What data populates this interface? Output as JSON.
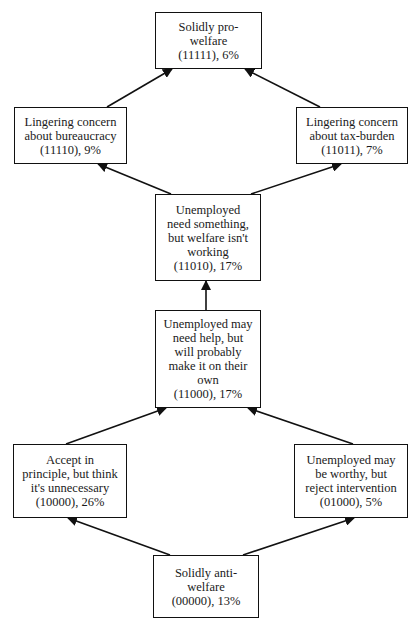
{
  "diagram": {
    "type": "hierarchical-flow",
    "colors": {
      "stroke": "#111111",
      "text": "#1a1a1a",
      "background": "#ffffff"
    },
    "nodes": [
      {
        "id": "11111",
        "lines": [
          "Solidly pro-",
          "welfare",
          "(11111), 6%"
        ],
        "label": "Solidly pro-welfare",
        "code": "11111",
        "percent": "6%"
      },
      {
        "id": "11110",
        "lines": [
          "Lingering concern",
          "about bureaucracy",
          "(11110),  9%"
        ],
        "label": "Lingering concern about bureaucracy",
        "code": "11110",
        "percent": "9%"
      },
      {
        "id": "11011",
        "lines": [
          "Lingering concern",
          "about tax-burden",
          "(11011), 7%"
        ],
        "label": "Lingering concern about tax-burden",
        "code": "11011",
        "percent": "7%"
      },
      {
        "id": "11010",
        "lines": [
          "Unemployed",
          "need something,",
          "but welfare isn't",
          "working",
          "(11010), 17%"
        ],
        "label": "Unemployed need something, but welfare isn't working",
        "code": "11010",
        "percent": "17%"
      },
      {
        "id": "11000",
        "lines": [
          "Unemployed may",
          "need help, but",
          "will probably",
          "make it on their",
          "own",
          "(11000), 17%"
        ],
        "label": "Unemployed may need help, but will probably make it on their own",
        "code": "11000",
        "percent": "17%"
      },
      {
        "id": "10000",
        "lines": [
          "Accept in",
          "principle, but think",
          "it's unnecessary",
          "(10000), 26%"
        ],
        "label": "Accept in principle, but think it's unnecessary",
        "code": "10000",
        "percent": "26%"
      },
      {
        "id": "01000",
        "lines": [
          "Unemployed may",
          "be worthy, but",
          "reject intervention",
          "(01000), 5%"
        ],
        "label": "Unemployed may be worthy, but reject intervention",
        "code": "01000",
        "percent": "5%"
      },
      {
        "id": "00000",
        "lines": [
          "Solidly anti-",
          "welfare",
          "(00000), 13%"
        ],
        "label": "Solidly anti-welfare",
        "code": "00000",
        "percent": "13%"
      }
    ],
    "edges": [
      {
        "from": "00000",
        "to": "10000"
      },
      {
        "from": "00000",
        "to": "01000"
      },
      {
        "from": "10000",
        "to": "11000"
      },
      {
        "from": "01000",
        "to": "11000"
      },
      {
        "from": "11000",
        "to": "11010"
      },
      {
        "from": "11010",
        "to": "11110"
      },
      {
        "from": "11010",
        "to": "11011"
      },
      {
        "from": "11110",
        "to": "11111"
      },
      {
        "from": "11011",
        "to": "11111"
      }
    ]
  }
}
